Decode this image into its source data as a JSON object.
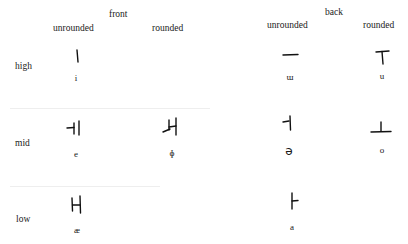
{
  "chart": {
    "columns": {
      "front": {
        "label": "front",
        "unrounded": "unrounded",
        "rounded": "rounded"
      },
      "back": {
        "label": "back",
        "unrounded": "unrounded",
        "rounded": "rounded"
      }
    },
    "rows": {
      "high": "high",
      "mid": "mid",
      "low": "low"
    },
    "cells": {
      "high_front_unrounded": {
        "letter": "ㅣ",
        "ipa": "i"
      },
      "high_back_unrounded": {
        "letter": "ㅡ",
        "ipa": "ɯ"
      },
      "high_back_rounded": {
        "letter": "ㅜ",
        "ipa": "u"
      },
      "mid_front_unrounded": {
        "letter": "ㅔ",
        "ipa": "e"
      },
      "mid_front_rounded": {
        "letter": "ㅚ",
        "ipa": "ɸ"
      },
      "mid_back_unrounded": {
        "letter": "ㅓ",
        "ipa": "ə"
      },
      "mid_back_rounded": {
        "letter": "ㅗ",
        "ipa": "o"
      },
      "low_front_unrounded": {
        "letter": "ㅐ",
        "ipa": "æ"
      },
      "low_back_unrounded": {
        "letter": "ㅏ",
        "ipa": "a"
      }
    }
  }
}
